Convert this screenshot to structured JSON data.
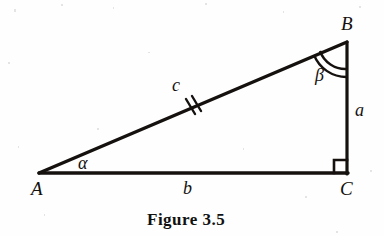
{
  "figure": {
    "caption": "Figure 3.5",
    "background_color": "#fefefe",
    "ink_color": "#15110f",
    "type": "geometry-diagram",
    "shape": "right-triangle",
    "vertices": [
      {
        "name": "A",
        "label": "A",
        "x": 39,
        "y": 173,
        "angle_marked": true
      },
      {
        "name": "B",
        "label": "B",
        "x": 347,
        "y": 42,
        "angle_marked": true
      },
      {
        "name": "C",
        "label": "C",
        "x": 347,
        "y": 173,
        "angle_marked": true
      }
    ],
    "vertex_labels": [
      {
        "text": "A",
        "x": 31,
        "y": 179
      },
      {
        "text": "B",
        "x": 341,
        "y": 14
      },
      {
        "text": "C",
        "x": 340,
        "y": 179
      }
    ],
    "sides": [
      {
        "name": "a",
        "label": "a",
        "from": "B",
        "to": "C",
        "label_x": 355,
        "label_y": 101,
        "tick_marks": 0
      },
      {
        "name": "b",
        "label": "b",
        "from": "A",
        "to": "C",
        "label_x": 183,
        "label_y": 179,
        "tick_marks": 0
      },
      {
        "name": "c",
        "label": "c",
        "from": "A",
        "to": "B",
        "label_x": 172,
        "label_y": 76,
        "tick_marks": 2
      }
    ],
    "angles": [
      {
        "name": "alpha",
        "label": "α",
        "vertex": "A",
        "label_x": 78,
        "label_y": 154,
        "marker": "none"
      },
      {
        "name": "beta",
        "label": "β",
        "vertex": "B",
        "label_x": 315,
        "label_y": 66,
        "marker": "double-arc"
      },
      {
        "name": "gamma",
        "label": "",
        "vertex": "C",
        "label_x": 0,
        "label_y": 0,
        "marker": "right-angle-square"
      }
    ],
    "caption_x": 147,
    "caption_y": 210
  }
}
